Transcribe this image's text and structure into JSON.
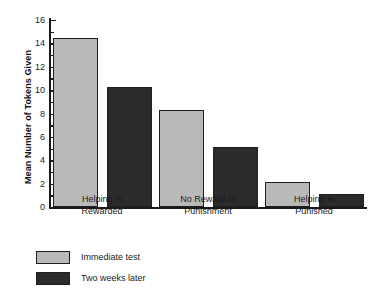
{
  "chart_data": {
    "type": "bar",
    "title": "",
    "xlabel": "",
    "ylabel": "Mean Number of Tokens Given",
    "ylim": [
      0,
      16
    ],
    "ytick_step": 2,
    "yticks": [
      0,
      2,
      4,
      6,
      8,
      10,
      12,
      14,
      16
    ],
    "ytick_labels": [
      "0",
      "2",
      "4",
      "6",
      "8",
      "10",
      "12",
      "14",
      "16"
    ],
    "minor_ticks": [
      1,
      3,
      5,
      7,
      9,
      11,
      13,
      15
    ],
    "grid": false,
    "legend_position": "bottom-left",
    "categories": [
      "Helping Is Rewarded",
      "No Reward or Punishment",
      "Helping Is Punished"
    ],
    "category_lines": [
      [
        "Helping Is",
        "Rewarded"
      ],
      [
        "No Reward or",
        "Punishment"
      ],
      [
        "Helping Is",
        "Punished"
      ]
    ],
    "series": [
      {
        "name": "Immediate test",
        "color": "#b9b9b9",
        "values": [
          14.5,
          8.3,
          2.1
        ]
      },
      {
        "name": "Two weeks later",
        "color": "#2b2b2b",
        "values": [
          10.3,
          5.1,
          1.1
        ]
      }
    ]
  },
  "colors": {
    "axis": "#1a1a1a",
    "bar_border": "#1f1f1f",
    "immediate_test": "#b9b9b9",
    "two_weeks_later": "#2b2b2b",
    "background": "#ffffff"
  }
}
